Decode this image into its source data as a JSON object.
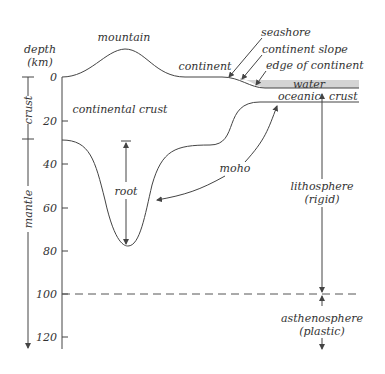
{
  "diagram": {
    "axis": {
      "title_line1": "depth",
      "title_line2": "(km)",
      "ticks": [
        "0",
        "20",
        "40",
        "60",
        "80",
        "100",
        "120"
      ]
    },
    "layers_bracket": {
      "crust": "crust",
      "mantle": "mantle"
    },
    "labels": {
      "mountain": "mountain",
      "continent": "continent",
      "seashore": "seashore",
      "continent_slope": "continent slope",
      "edge_of_continent": "edge of continent",
      "water": "water",
      "oceanic": "oceanic",
      "crust": "crust",
      "continental_crust": "continental crust",
      "root": "root",
      "moho": "moho",
      "lithosphere": "lithosphere",
      "rigid": "(rigid)",
      "asthenosphere": "asthenosphere",
      "plastic": "(plastic)"
    },
    "colors": {
      "water_fill": "#d4d4d4",
      "line": "#444444",
      "text": "#333333"
    }
  }
}
